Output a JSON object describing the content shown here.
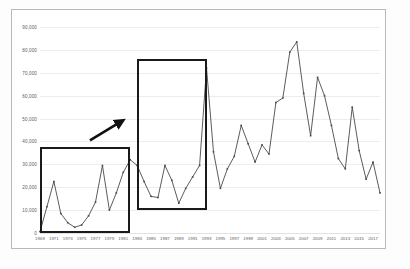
{
  "page": {
    "background_color": "#ffffff",
    "frame_color": "#b9b9b9"
  },
  "chart_data": {
    "type": "line",
    "title": "",
    "subtitle": "",
    "xlabel": "",
    "ylabel": "",
    "grid": true,
    "legend": "none",
    "line_color": "#4a4a4a",
    "marker": "square",
    "ylim": [
      0,
      90000
    ],
    "y_ticks": [
      0,
      10000,
      20000,
      30000,
      40000,
      50000,
      60000,
      70000,
      80000,
      90000
    ],
    "y_tick_labels": [
      "0",
      "10,000",
      "20,000",
      "30,000",
      "40,000",
      "50,000",
      "60,000",
      "70,000",
      "80,000",
      "90,000"
    ],
    "x_tick_labels": [
      "1969",
      "1971",
      "1973",
      "1975",
      "1977",
      "1979",
      "1981",
      "1983",
      "1985",
      "1987",
      "1989",
      "1991",
      "1993",
      "1995",
      "1997",
      "1999",
      "2001",
      "2003",
      "2005",
      "2007",
      "2009",
      "2011",
      "2013",
      "2015",
      "2017"
    ],
    "x": [
      1969,
      1970,
      1971,
      1972,
      1973,
      1974,
      1975,
      1976,
      1977,
      1978,
      1979,
      1980,
      1981,
      1982,
      1983,
      1984,
      1985,
      1986,
      1987,
      1988,
      1989,
      1990,
      1991,
      1992,
      1993,
      1994,
      1995,
      1996,
      1997,
      1998,
      1999,
      2000,
      2001,
      2002,
      2003,
      2004,
      2005,
      2006,
      2007,
      2008,
      2009,
      2010,
      2011,
      2012,
      2013,
      2014,
      2015,
      2016,
      2017,
      2018
    ],
    "values": [
      600,
      11500,
      22500,
      8500,
      4500,
      2500,
      3500,
      7500,
      13500,
      29500,
      10000,
      17500,
      26500,
      32000,
      29500,
      22500,
      16000,
      15500,
      29500,
      23000,
      13000,
      19500,
      24500,
      29500,
      72000,
      35500,
      19500,
      28000,
      33500,
      47000,
      39000,
      31000,
      38500,
      34500,
      57000,
      59000,
      79000,
      83500,
      61000,
      42500,
      68000,
      60000,
      47000,
      32500,
      28000,
      55000,
      36000,
      23500,
      31000,
      17500
    ],
    "tail_values_note": "",
    "series": [
      {
        "name": "series-1",
        "values": [
          600,
          11500,
          22500,
          8500,
          4500,
          2500,
          3500,
          7500,
          13500,
          29500,
          10000,
          17500,
          26500,
          32000,
          29500,
          22500,
          16000,
          15500,
          29500,
          23000,
          13000,
          19500,
          24500,
          29500,
          72000,
          35500,
          19500,
          28000,
          33500,
          47000,
          39000,
          31000,
          38500,
          34500,
          57000,
          59000,
          79000,
          83500,
          61000,
          42500,
          68000,
          60000,
          47000,
          32500,
          28000,
          55000,
          36000,
          23500,
          31000,
          17500
        ]
      }
    ]
  },
  "annotations": {
    "boxes": [
      {
        "name": "left-highlight-box",
        "x_start": 1969,
        "x_end": 1982,
        "y_bottom": 0,
        "y_top": 37500,
        "color": "#1a1a1a"
      },
      {
        "name": "right-highlight-box",
        "x_start": 1983,
        "x_end": 1993,
        "y_bottom": 10000,
        "y_top": 76000,
        "color": "#1a1a1a"
      }
    ],
    "arrow": {
      "name": "emphasis-arrow",
      "color": "#111111",
      "points_to": "right-highlight-box",
      "direction": "up-right"
    }
  }
}
